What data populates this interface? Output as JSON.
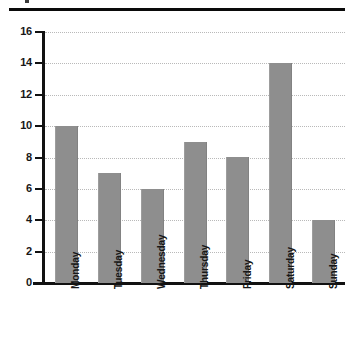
{
  "page": {
    "background_color": "#ffffff",
    "separator_rule_color": "#0a0a0a"
  },
  "chart_data": {
    "type": "bar",
    "title": "",
    "subtitle": "",
    "xlabel": "",
    "ylabel": "",
    "categories": [
      "Monday",
      "Tuesday",
      "Wednesday",
      "Thursday",
      "Friday",
      "Saturday",
      "Sunday"
    ],
    "values": [
      10,
      7,
      6,
      9,
      8,
      14,
      4
    ],
    "ylim": [
      0,
      16
    ],
    "ytick_labels": [
      "0",
      "2",
      "4",
      "6",
      "8",
      "10",
      "12",
      "14",
      "16"
    ],
    "ytick_values": [
      0,
      2,
      4,
      6,
      8,
      10,
      12,
      14,
      16
    ],
    "grid": true,
    "grid_axis": "y",
    "grid_style": "dotted",
    "grid_color": "#b9b9b9",
    "legend": false,
    "legend_position": "none",
    "bar_color": "#8e8e8e",
    "axis_color": "#111111",
    "tick_label_color": "#171717",
    "xtick_label_rotation": -90
  }
}
